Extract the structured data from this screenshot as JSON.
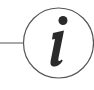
{
  "icon": {
    "name": "info-icon",
    "glyph": "i",
    "stroke_color": "#3a3a3a",
    "fill_color": "#2a2a2a",
    "background": "#ffffff"
  }
}
